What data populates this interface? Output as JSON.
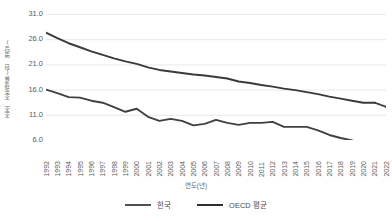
{
  "chart_data": {
    "type": "line",
    "title": "",
    "xlabel": "연도(년)",
    "ylabel": "조조 조출생률(천 명당)",
    "ylim": [
      6.0,
      31.0
    ],
    "yticks": [
      "31.0",
      "26.0",
      "21.0",
      "16.0",
      "11.0",
      "6.0"
    ],
    "ytick_values": [
      31.0,
      26.0,
      21.0,
      16.0,
      11.0,
      6.0
    ],
    "grid": true,
    "legend_position": "bottom",
    "categories": [
      "1992",
      "1993",
      "1994",
      "1995",
      "1996",
      "1997",
      "1998",
      "1999",
      "2000",
      "2001",
      "2002",
      "2003",
      "2004",
      "2005",
      "2006",
      "2007",
      "2008",
      "2009",
      "2010",
      "2011",
      "2012",
      "2013",
      "2014",
      "2015",
      "2016",
      "2017",
      "2018",
      "2019",
      "2020",
      "2021",
      "2022"
    ],
    "series": [
      {
        "name": "한국",
        "color": "#404040",
        "style": "solid",
        "values": [
          16.0,
          15.3,
          14.5,
          14.4,
          13.8,
          13.4,
          12.5,
          11.6,
          12.2,
          10.6,
          9.8,
          10.2,
          9.8,
          8.9,
          9.2,
          10.0,
          9.4,
          9.0,
          9.4,
          9.4,
          9.6,
          8.6,
          8.6,
          8.6,
          7.9,
          7.0,
          6.4,
          5.9,
          5.3,
          5.1,
          4.9
        ]
      },
      {
        "name": "OECD 평균",
        "color": "#3a3a3a",
        "style": "solid",
        "dashed_from": "2021",
        "values": [
          27.3,
          26.2,
          25.2,
          24.4,
          23.6,
          22.9,
          22.2,
          21.6,
          21.1,
          20.4,
          19.9,
          19.6,
          19.3,
          19.0,
          18.8,
          18.5,
          18.2,
          17.6,
          17.3,
          16.9,
          16.6,
          16.2,
          15.9,
          15.5,
          15.1,
          14.6,
          14.2,
          13.8,
          13.4,
          13.4,
          12.6
        ]
      }
    ]
  },
  "legend": {
    "items": [
      {
        "label": "한국",
        "color": "#505050"
      },
      {
        "label": "OECD 평균",
        "color": "#2f2f2f"
      }
    ]
  },
  "axes": {
    "x_title": "연도(년)",
    "y_title": "조조 조출생률(천 명당)"
  }
}
